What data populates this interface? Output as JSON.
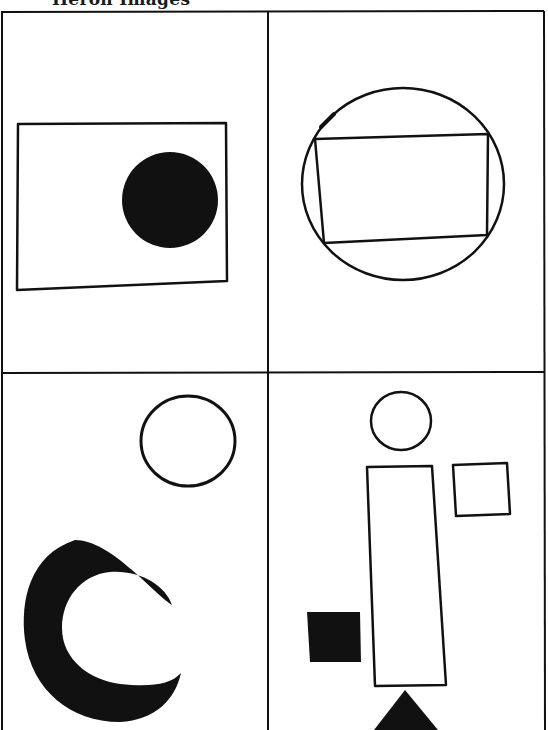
{
  "header": {
    "title": "Heron Images"
  },
  "panels": [
    {
      "id": "top-left",
      "label": "Rectangle with filled circle"
    },
    {
      "id": "top-right",
      "label": "Rectangle inscribed in circle"
    },
    {
      "id": "bottom-left",
      "label": "Outline circle and filled crescent"
    },
    {
      "id": "bottom-right",
      "label": "Circle over tall rectangle with squares and triangle"
    }
  ],
  "colors": {
    "ink": "#111111",
    "paper": "#ffffff"
  }
}
